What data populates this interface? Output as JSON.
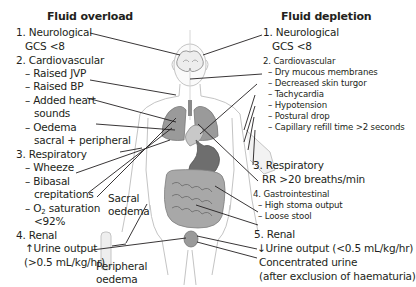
{
  "left_panel": {
    "title": "Fluid overload",
    "items": [
      {
        "label": "1. Neurological",
        "details": [
          "GCS <8"
        ]
      },
      {
        "label": "2. Cardiovascular",
        "details": [
          "– Raised JVP",
          "– Raised BP",
          "– Added heart",
          "sounds",
          "– Oedema",
          "sacral + peripheral"
        ]
      },
      {
        "label": "3. Respiratory",
        "details": [
          "– Wheeze",
          "– Bibasal",
          "crepitations",
          "– O",
          "2",
          " saturation",
          "<92%"
        ]
      },
      {
        "label": "4. Renal",
        "details": [
          "↑Urine output",
          "(>0.5 mL/kg/hr)"
        ]
      }
    ]
  },
  "right_panel": {
    "title": "Fluid depletion",
    "items": [
      {
        "label": "1. Neurological",
        "details": [
          "GCS <8"
        ]
      },
      {
        "label": "2. Cardiovascular",
        "details": [
          "– Dry mucous membranes",
          "– Decreased skin turgor",
          "– Tachycardia",
          "– Hypotension",
          "– Postural drop",
          "– Capillary refill time >2 seconds"
        ]
      },
      {
        "label": "3. Respiratory",
        "details": [
          "RR >20 breaths/min"
        ]
      },
      {
        "label": "4. Gastrointestinal",
        "details": [
          "– High stoma output",
          "– Loose stool"
        ]
      },
      {
        "label": "5. Renal",
        "details": [
          "↓Urine output (<0.5 mL/kg/hr)",
          "Concentrated urine",
          "(after exclusion of haematuria)"
        ]
      }
    ]
  },
  "figure_labels": {
    "sacral": [
      "Sacral",
      "oedema"
    ],
    "peripheral": [
      "Peripheral",
      "oedema"
    ]
  },
  "colors": {
    "text": "#231f20",
    "leader_line": "#231f20",
    "body_outline": "#bdbdbd",
    "organ_fill": "#8c8c8c",
    "organ_light": "#b5b5b5"
  }
}
